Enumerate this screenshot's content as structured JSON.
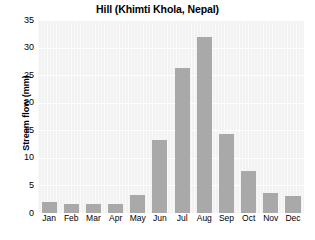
{
  "chart_data": {
    "type": "bar",
    "title": "Hill (Khimti Khola, Nepal)",
    "xlabel": "",
    "ylabel": "Stream flow (mm)",
    "categories": [
      "Jan",
      "Feb",
      "Mar",
      "Apr",
      "May",
      "Jun",
      "Jul",
      "Aug",
      "Sep",
      "Oct",
      "Nov",
      "Dec"
    ],
    "values": [
      2.0,
      1.7,
      1.7,
      1.7,
      3.3,
      13.2,
      26.3,
      32.0,
      14.3,
      7.7,
      3.7,
      3.1
    ],
    "ylim": [
      0,
      35
    ],
    "yticks": [
      0,
      5,
      10,
      15,
      20,
      25,
      30,
      35
    ],
    "ytick_labels": [
      "0",
      "5",
      "10",
      "15",
      "20",
      "25",
      "30",
      "35"
    ],
    "grid": true,
    "grid_axis": "y",
    "legend": false,
    "bar_color": "#a9a9a9",
    "plot_background": "#f2f2f2",
    "gridline_color": "#ffffff",
    "text_color": "#000000"
  }
}
